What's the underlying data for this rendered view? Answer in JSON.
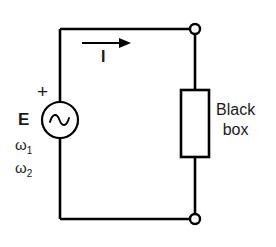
{
  "figure": {
    "type": "circuit-schematic",
    "background_color": "#ffffff",
    "line_color": "#000000",
    "text_color": "#1a1a1a"
  },
  "labels": {
    "source_label": "E",
    "polarity_plus": "+",
    "omega1_symbol": "ω",
    "omega1_subscript": "1",
    "omega2_symbol": "ω",
    "omega2_subscript": "2",
    "current_label": "I",
    "blackbox_line1": "Black",
    "blackbox_line2": "box"
  },
  "components": {
    "source": {
      "name": "ac-voltage-source",
      "symbol": "sine-wave-in-circle",
      "center_x": 60,
      "center_y": 120,
      "radius": 18
    },
    "blackbox": {
      "name": "black-box-rectangle",
      "x": 181,
      "y": 90,
      "width": 28,
      "height": 67
    },
    "terminal_top": {
      "name": "terminal-top",
      "cx": 195,
      "cy": 29,
      "r": 5
    },
    "terminal_bottom": {
      "name": "terminal-bottom",
      "cx": 195,
      "cy": 219,
      "r": 5
    },
    "current_arrow": {
      "name": "current-direction-arrow",
      "x_start": 82,
      "x_end": 131,
      "y": 43,
      "direction": "right"
    }
  },
  "wires": {
    "left_vertical_x": 60,
    "right_vertical_x": 195,
    "top_y": 29,
    "bottom_y": 219
  }
}
